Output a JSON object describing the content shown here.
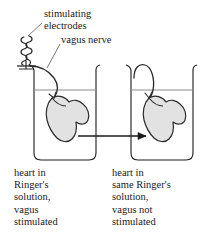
{
  "figure": {
    "stroke_color": "#1a1a1a",
    "heart_fill_color": "#e2e2e2",
    "background_color": "#ffffff"
  },
  "callouts": {
    "electrodes_label": "stimulating\nelectrodes",
    "electrodes_line1": "stimulating",
    "electrodes_line2": "electrodes",
    "vagus_label": "vagus nerve"
  },
  "captions": {
    "left": "heart in\nRinger's\nsolution,\nvagus\nstimulated",
    "right": "heart in\nsame Ringer's\nsolution,\nvagus not\nstimulated"
  },
  "parts": {
    "left_beaker": "left-beaker",
    "right_beaker": "right-beaker",
    "left_heart": "left-heart",
    "right_heart": "right-heart",
    "electrode_coil": "stimulating-electrode-coil",
    "vagus_nerve_strand": "vagus-nerve",
    "transfer_tube": "solution-transfer-tube",
    "transfer_arrow": "solution-transfer-arrow",
    "left_fluid_line": "left-fluid-surface",
    "right_fluid_line": "right-fluid-surface",
    "right_cannula": "right-cannula"
  }
}
